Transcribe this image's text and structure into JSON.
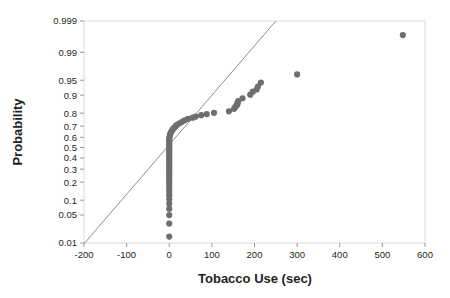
{
  "chart_data": {
    "type": "scatter",
    "title": "",
    "subtitle": "",
    "xlabel": "Tobacco Use (sec)",
    "ylabel": "Probability",
    "xlim": [
      -200,
      600
    ],
    "ylim": [
      0.01,
      0.999
    ],
    "grid": false,
    "legend": "none",
    "xticks": [
      -200,
      -100,
      0,
      100,
      200,
      300,
      400,
      500,
      600
    ],
    "xticklabels": [
      "-200",
      "-100",
      "0",
      "100",
      "200",
      "300",
      "400",
      "500",
      "600"
    ],
    "yticks": [
      0.01,
      0.05,
      0.1,
      0.2,
      0.3,
      0.4,
      0.5,
      0.6,
      0.7,
      0.8,
      0.9,
      0.95,
      0.99,
      0.999
    ],
    "yticklabels": [
      "0.01",
      "0.05",
      "0.1",
      "0.2",
      "0.3",
      "0.4",
      "0.5",
      "0.6",
      "0.7",
      "0.8",
      "0.9",
      "0.95",
      "0.99",
      "0.999"
    ],
    "y_scale": "normal-probability",
    "series": [
      {
        "name": "Tobacco Use normal probability plot",
        "marker": "circle",
        "color": "#6e6e6e",
        "marker_size": 3.1,
        "points": [
          [
            0,
            0.015
          ],
          [
            0,
            0.032
          ],
          [
            0,
            0.05
          ],
          [
            0,
            0.068
          ],
          [
            0,
            0.086
          ],
          [
            0,
            0.104
          ],
          [
            0,
            0.122
          ],
          [
            0,
            0.14
          ],
          [
            0,
            0.158
          ],
          [
            0,
            0.176
          ],
          [
            0,
            0.194
          ],
          [
            0,
            0.212
          ],
          [
            0,
            0.23
          ],
          [
            0,
            0.248
          ],
          [
            0,
            0.266
          ],
          [
            0,
            0.284
          ],
          [
            0,
            0.302
          ],
          [
            0,
            0.32
          ],
          [
            0,
            0.338
          ],
          [
            0,
            0.356
          ],
          [
            0,
            0.374
          ],
          [
            0,
            0.392
          ],
          [
            0,
            0.41
          ],
          [
            0,
            0.428
          ],
          [
            0,
            0.446
          ],
          [
            0,
            0.464
          ],
          [
            0,
            0.482
          ],
          [
            0,
            0.5
          ],
          [
            0,
            0.518
          ],
          [
            0,
            0.536
          ],
          [
            0,
            0.554
          ],
          [
            0,
            0.572
          ],
          [
            0,
            0.59
          ],
          [
            1,
            0.608
          ],
          [
            2,
            0.624
          ],
          [
            3,
            0.638
          ],
          [
            5,
            0.652
          ],
          [
            7,
            0.664
          ],
          [
            9,
            0.676
          ],
          [
            12,
            0.688
          ],
          [
            15,
            0.7
          ],
          [
            18,
            0.712
          ],
          [
            24,
            0.724
          ],
          [
            30,
            0.736
          ],
          [
            36,
            0.748
          ],
          [
            44,
            0.758
          ],
          [
            55,
            0.768
          ],
          [
            62,
            0.776
          ],
          [
            75,
            0.786
          ],
          [
            88,
            0.794
          ],
          [
            105,
            0.802
          ],
          [
            140,
            0.812
          ],
          [
            152,
            0.828
          ],
          [
            155,
            0.84
          ],
          [
            158,
            0.848
          ],
          [
            160,
            0.856
          ],
          [
            160,
            0.864
          ],
          [
            162,
            0.872
          ],
          [
            172,
            0.886
          ],
          [
            190,
            0.902
          ],
          [
            196,
            0.914
          ],
          [
            205,
            0.922
          ],
          [
            208,
            0.932
          ],
          [
            215,
            0.944
          ],
          [
            300,
            0.963
          ],
          [
            548,
            0.997
          ]
        ]
      }
    ],
    "reference_line": {
      "name": "normal reference line",
      "color": "#808080",
      "x_start": -200,
      "y_start": 0.0095,
      "x_end": 250,
      "y_end": 0.999
    }
  },
  "axes": {
    "frame_color": "#d9d9d9",
    "background": "#ffffff"
  }
}
